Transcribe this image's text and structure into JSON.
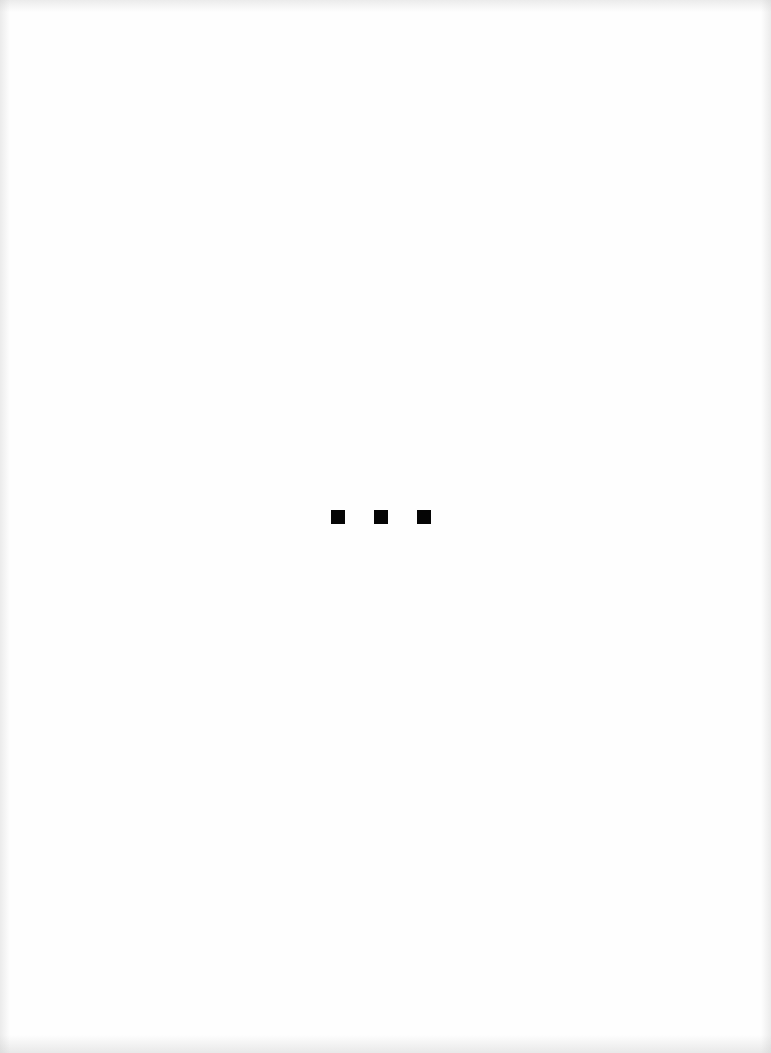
{
  "page": {
    "type": "scanned-page",
    "background_color": "#fefefe",
    "content_visible": false
  },
  "ellipsis_marker": {
    "label": "■ ■ ■",
    "dot_count": 3,
    "dot_color": "#050505",
    "dots": [
      {
        "x": 331,
        "y": 510,
        "size": 14
      },
      {
        "x": 374,
        "y": 510,
        "size": 14
      },
      {
        "x": 417,
        "y": 510,
        "size": 14
      }
    ]
  }
}
